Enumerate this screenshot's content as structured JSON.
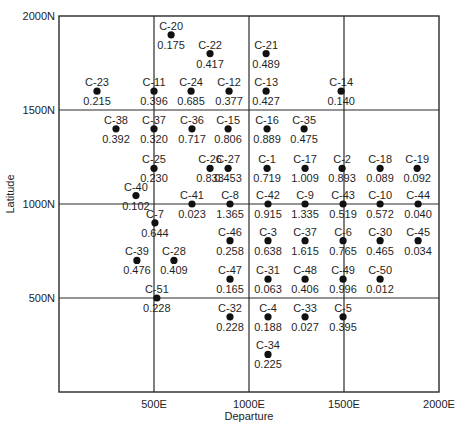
{
  "chart_data": {
    "type": "scatter",
    "title": "",
    "xlabel": "Departure",
    "ylabel": "Latitude",
    "xlim": [
      0,
      2000
    ],
    "ylim": [
      0,
      2000
    ],
    "grid": true,
    "grid_lines_x": [
      500,
      1000,
      1500
    ],
    "grid_lines_y": [
      500,
      1000,
      1500
    ],
    "x_ticks": [
      {
        "value": 500,
        "label": "500E"
      },
      {
        "value": 1000,
        "label": "1000E"
      },
      {
        "value": 1500,
        "label": "1500E"
      },
      {
        "value": 2000,
        "label": "2000E"
      }
    ],
    "y_ticks": [
      {
        "value": 500,
        "label": "500N"
      },
      {
        "value": 1000,
        "label": "1000N"
      },
      {
        "value": 1500,
        "label": "1500N"
      },
      {
        "value": 2000,
        "label": "2000N"
      }
    ],
    "legend": null,
    "points": [
      {
        "id": "C-20",
        "x": 590,
        "y": 1900,
        "value": "0.175"
      },
      {
        "id": "C-22",
        "x": 795,
        "y": 1800,
        "value": "0.417"
      },
      {
        "id": "C-21",
        "x": 1090,
        "y": 1800,
        "value": "0.489"
      },
      {
        "id": "C-23",
        "x": 200,
        "y": 1600,
        "value": "0.215"
      },
      {
        "id": "C-11",
        "x": 500,
        "y": 1600,
        "value": "0.396"
      },
      {
        "id": "C-24",
        "x": 695,
        "y": 1600,
        "value": "0.685"
      },
      {
        "id": "C-12",
        "x": 895,
        "y": 1600,
        "value": "0.377"
      },
      {
        "id": "C-13",
        "x": 1090,
        "y": 1600,
        "value": "0.427"
      },
      {
        "id": "C-14",
        "x": 1485,
        "y": 1600,
        "value": "0.140"
      },
      {
        "id": "C-38",
        "x": 300,
        "y": 1400,
        "value": "0.392"
      },
      {
        "id": "C-37",
        "x": 500,
        "y": 1400,
        "value": "0.320"
      },
      {
        "id": "C-36",
        "x": 700,
        "y": 1400,
        "value": "0.717"
      },
      {
        "id": "C-15",
        "x": 890,
        "y": 1400,
        "value": "0.806"
      },
      {
        "id": "C-16",
        "x": 1095,
        "y": 1400,
        "value": "0.889"
      },
      {
        "id": "C-35",
        "x": 1290,
        "y": 1400,
        "value": "0.475"
      },
      {
        "id": "C-25",
        "x": 500,
        "y": 1190,
        "value": "0.230"
      },
      {
        "id": "C-26",
        "x": 795,
        "y": 1190,
        "value": "0.833"
      },
      {
        "id": "C-27",
        "x": 890,
        "y": 1190,
        "value": "0.453"
      },
      {
        "id": "C-1",
        "x": 1095,
        "y": 1190,
        "value": "0.719"
      },
      {
        "id": "C-17",
        "x": 1295,
        "y": 1190,
        "value": "1.009"
      },
      {
        "id": "C-2",
        "x": 1490,
        "y": 1190,
        "value": "0.893"
      },
      {
        "id": "C-18",
        "x": 1690,
        "y": 1190,
        "value": "0.089"
      },
      {
        "id": "C-19",
        "x": 1885,
        "y": 1190,
        "value": "0.092"
      },
      {
        "id": "C-40",
        "x": 405,
        "y": 1045,
        "value": "0.102"
      },
      {
        "id": "C-41",
        "x": 700,
        "y": 1000,
        "value": "0.023"
      },
      {
        "id": "C-8",
        "x": 900,
        "y": 1000,
        "value": "1.365"
      },
      {
        "id": "C-42",
        "x": 1100,
        "y": 1000,
        "value": "0.915"
      },
      {
        "id": "C-9",
        "x": 1295,
        "y": 1000,
        "value": "1.335"
      },
      {
        "id": "C-43",
        "x": 1495,
        "y": 1000,
        "value": "0.519"
      },
      {
        "id": "C-10",
        "x": 1690,
        "y": 1000,
        "value": "0.572"
      },
      {
        "id": "C-44",
        "x": 1890,
        "y": 1000,
        "value": "0.040"
      },
      {
        "id": "C-7",
        "x": 505,
        "y": 900,
        "value": "0.644"
      },
      {
        "id": "C-46",
        "x": 900,
        "y": 805,
        "value": "0.258"
      },
      {
        "id": "C-3",
        "x": 1100,
        "y": 805,
        "value": "0.638"
      },
      {
        "id": "C-37",
        "x": 1295,
        "y": 805,
        "value": "1.615"
      },
      {
        "id": "C-6",
        "x": 1495,
        "y": 805,
        "value": "0.765"
      },
      {
        "id": "C-30",
        "x": 1690,
        "y": 805,
        "value": "0.465"
      },
      {
        "id": "C-45",
        "x": 1890,
        "y": 805,
        "value": "0.034"
      },
      {
        "id": "C-39",
        "x": 410,
        "y": 700,
        "value": "0.476"
      },
      {
        "id": "C-28",
        "x": 605,
        "y": 700,
        "value": "0.409"
      },
      {
        "id": "C-47",
        "x": 900,
        "y": 600,
        "value": "0.165"
      },
      {
        "id": "C-31",
        "x": 1100,
        "y": 600,
        "value": "0.063"
      },
      {
        "id": "C-48",
        "x": 1295,
        "y": 600,
        "value": "0.406"
      },
      {
        "id": "C-49",
        "x": 1495,
        "y": 600,
        "value": "0.996"
      },
      {
        "id": "C-50",
        "x": 1690,
        "y": 600,
        "value": "0.012"
      },
      {
        "id": "C-51",
        "x": 515,
        "y": 500,
        "value": "0.228"
      },
      {
        "id": "C-32",
        "x": 900,
        "y": 400,
        "value": "0.228"
      },
      {
        "id": "C-4",
        "x": 1100,
        "y": 400,
        "value": "0.188"
      },
      {
        "id": "C-33",
        "x": 1295,
        "y": 400,
        "value": "0.027"
      },
      {
        "id": "C-5",
        "x": 1495,
        "y": 400,
        "value": "0.395"
      },
      {
        "id": "C-34",
        "x": 1100,
        "y": 200,
        "value": "0.225"
      }
    ]
  },
  "colors": {
    "background": "#ffffff",
    "axis": "#2a2a2a",
    "marker": "#111111",
    "text": "#1f1f1f"
  }
}
